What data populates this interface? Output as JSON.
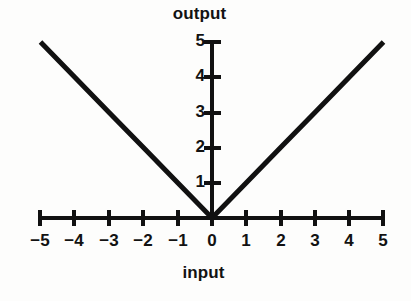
{
  "figure": {
    "background_color": "#fdfdfc",
    "ink_color": "#111111",
    "x_axis_title": "input",
    "y_axis_title": "output"
  },
  "chart_data": {
    "type": "line",
    "title": "",
    "subtitle": "",
    "xlabel": "input",
    "ylabel": "output",
    "xlim": [
      -5,
      5
    ],
    "ylim": [
      0,
      5
    ],
    "grid": false,
    "legend": false,
    "legend_position": "none",
    "x_ticks": [
      -5,
      -4,
      -3,
      -2,
      -1,
      0,
      1,
      2,
      3,
      4,
      5
    ],
    "x_tick_labels": [
      "−5",
      "−4",
      "−3",
      "−2",
      "−1",
      "0",
      "1",
      "2",
      "3",
      "4",
      "5"
    ],
    "y_ticks": [
      1,
      2,
      3,
      4,
      5
    ],
    "y_tick_labels": [
      "1",
      "2",
      "3",
      "4",
      "5"
    ],
    "series": [
      {
        "name": "output = |input|",
        "x": [
          -5,
          -4,
          -3,
          -2,
          -1,
          0,
          1,
          2,
          3,
          4,
          5
        ],
        "values": [
          5,
          4,
          3,
          2,
          1,
          0,
          1,
          2,
          3,
          4,
          5
        ],
        "color": "#111111",
        "line_width": 5
      }
    ],
    "annotations": []
  }
}
